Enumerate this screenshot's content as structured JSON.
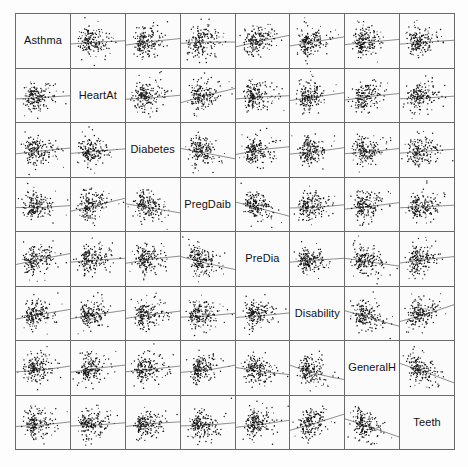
{
  "figure": {
    "title": "",
    "type": "scatterplot-matrix",
    "background_color": "#fdfdfd",
    "panel_color": "#fbfbfb",
    "grid_line_color": "#6a6a6a",
    "point_color": "#141414",
    "trend_line_color": "#1a1a1a",
    "rows": 8,
    "columns": 8
  },
  "chart_data": {
    "type": "scatter",
    "title": "",
    "xlabel": "",
    "ylabel": "",
    "layout": "scatterplot-matrix",
    "grid": false,
    "legend": "none",
    "n_variables": 8,
    "n_points_per_panel": 180,
    "diagonal": "variable-name",
    "variables": [
      "Asthma",
      "HeartAt",
      "Diabetes",
      "PregDaib",
      "PreDia",
      "Disability",
      "GeneralH",
      "Teeth"
    ],
    "panel_trends": [
      [
        null,
        0.05,
        0.1,
        0.02,
        0.18,
        0.14,
        0.08,
        0.06
      ],
      [
        0.05,
        null,
        0.06,
        0.22,
        0.05,
        0.12,
        0.1,
        0.04
      ],
      [
        0.09,
        0.07,
        null,
        -0.16,
        0.12,
        0.1,
        0.08,
        0.06
      ],
      [
        0.03,
        0.2,
        -0.14,
        null,
        -0.22,
        0.05,
        0.1,
        0.04
      ],
      [
        0.17,
        0.06,
        0.11,
        -0.2,
        null,
        0.06,
        -0.12,
        0.1
      ],
      [
        0.15,
        0.13,
        0.11,
        0.06,
        0.07,
        null,
        -0.24,
        0.26
      ],
      [
        0.09,
        0.11,
        0.09,
        0.11,
        -0.11,
        -0.22,
        null,
        -0.3
      ],
      [
        0.07,
        0.05,
        0.07,
        0.05,
        0.11,
        0.25,
        -0.28,
        null
      ]
    ]
  }
}
